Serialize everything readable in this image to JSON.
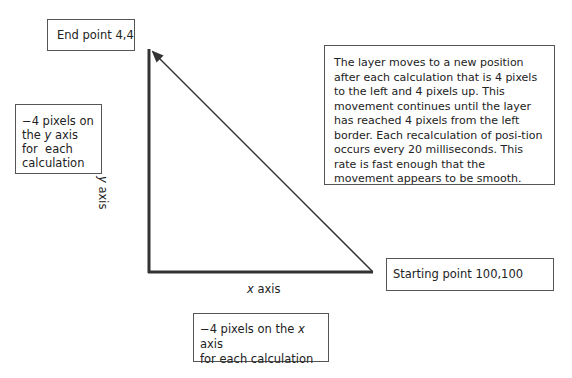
{
  "diagram": {
    "end_point": "End point 4,4",
    "start_point": "Starting point 100,100",
    "y_note": {
      "line1": "−4 pixels on",
      "line2_pre": "the ",
      "line2_var": "y",
      "line2_post": " axis",
      "line3": "for  each",
      "line4": "calculation"
    },
    "x_note": {
      "line1_pre": "−4 pixels on the ",
      "line1_var": "x",
      "line1_post": " axis",
      "line2": "for each calculation"
    },
    "description": "The layer moves to a new position after each calculation that is 4 pixels to the left and 4 pixels up. This movement continues until the layer has reached 4 pixels from the left border. Each recalculation of posi-tion occurs every 20 milliseconds. This rate is fast enough that the movement appears to be smooth.",
    "x_axis_label_var": "x",
    "x_axis_label_post": " axis",
    "y_axis_label_var": "y",
    "y_axis_label_post": " axis"
  }
}
